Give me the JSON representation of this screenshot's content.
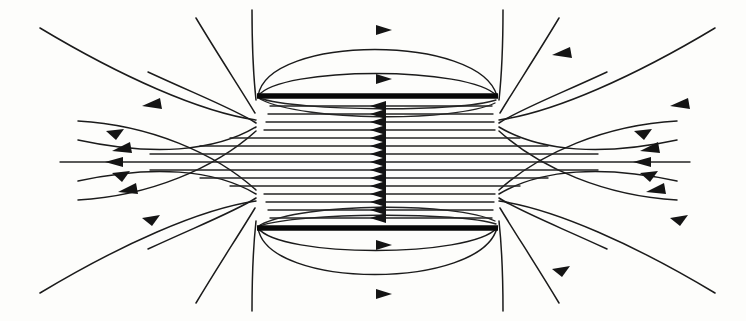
{
  "figure": {
    "width": 746,
    "height": 321,
    "background_color": "#fdfdfb",
    "line_color": "#1b1b1b",
    "plate_color": "#080808",
    "arrow_color": "#141414",
    "symmetry": "mirror about horizontal midline y=162",
    "axis_of_symmetry_y": 162,
    "vertical_center_x": 377
  },
  "plates": [
    {
      "name": "top-plate",
      "polarity": "positive",
      "x_start": 257,
      "x_end": 498,
      "y": 96,
      "thickness": 5.5,
      "length": 241
    },
    {
      "name": "bottom-plate",
      "polarity": "negative",
      "x_start": 257,
      "x_end": 498,
      "y": 228,
      "thickness": 5.5,
      "length": 241
    }
  ],
  "interior_field": {
    "description": "Uniform horizontal field lines between the plates, directed from bottom plate toward top plate region, drawn pointing left",
    "line_count": 15,
    "x_start": 270,
    "x_end": 492,
    "arrow_x": 378,
    "arrow_direction": "left",
    "y_values": [
      106,
      114,
      122,
      130,
      138,
      146,
      154,
      162,
      170,
      178,
      186,
      194,
      202,
      210,
      218
    ]
  },
  "outer_arcs": {
    "description": "Nested arcs bulging outward beyond each plate, arrowhead at apex pointing right",
    "arrow_direction": "right",
    "top": [
      {
        "apex_y": 27,
        "arrow_x": 377,
        "arrow_y": 30
      },
      {
        "apex_y": 77,
        "arrow_x": 377,
        "arrow_y": 79
      }
    ],
    "bottom": [
      {
        "apex_y": 297,
        "arrow_x": 377,
        "arrow_y": 294
      },
      {
        "apex_y": 247,
        "arrow_x": 377,
        "arrow_y": 245
      }
    ]
  },
  "fringing_field": {
    "description": "Fringing field lines fanning out from the plate edges into the exterior region",
    "left_edge_x": 257,
    "right_edge_x": 498,
    "arrow_direction": "left",
    "left_fan_arrow_x_range": [
      100,
      130
    ],
    "right_fan_arrow_x_range": [
      615,
      650
    ]
  },
  "legend": {
    "visible": false,
    "items": []
  },
  "labels": {
    "visible": false,
    "items": []
  }
}
